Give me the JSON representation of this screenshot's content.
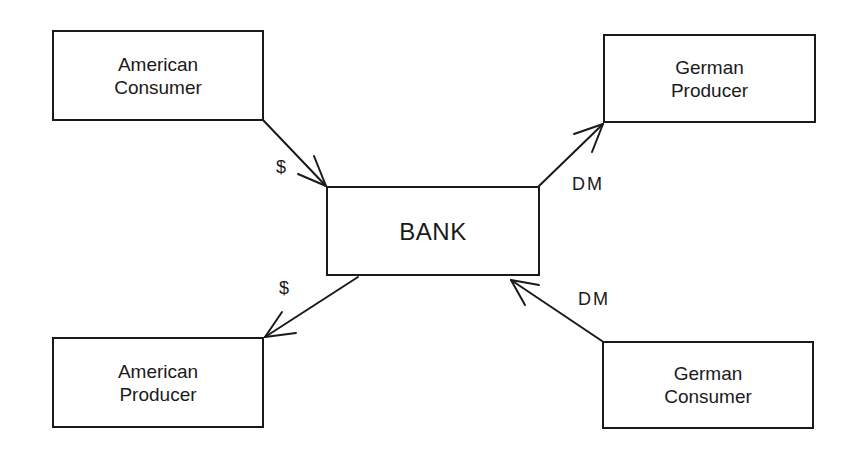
{
  "diagram": {
    "nodes": [
      {
        "id": "american-consumer",
        "lines": [
          "American",
          "Consumer"
        ]
      },
      {
        "id": "german-producer",
        "lines": [
          "German",
          "Producer"
        ]
      },
      {
        "id": "bank",
        "lines": [
          "BANK"
        ]
      },
      {
        "id": "american-producer",
        "lines": [
          "American",
          "Producer"
        ]
      },
      {
        "id": "german-consumer",
        "lines": [
          "German",
          "Consumer"
        ]
      }
    ],
    "edges": [
      {
        "from": "american-consumer",
        "to": "bank",
        "label": "$"
      },
      {
        "from": "bank",
        "to": "german-producer",
        "label": "DM"
      },
      {
        "from": "bank",
        "to": "american-producer",
        "label": "$"
      },
      {
        "from": "german-consumer",
        "to": "bank",
        "label": "DM"
      }
    ],
    "colors": {
      "stroke": "#1a1a1a",
      "background": "#ffffff"
    }
  }
}
